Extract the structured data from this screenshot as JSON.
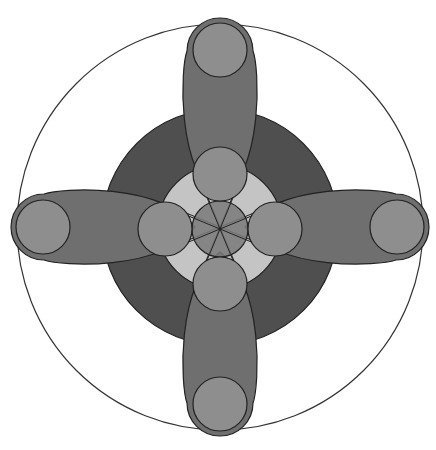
{
  "figure": {
    "width": 436,
    "height": 450,
    "center": [
      220,
      227
    ],
    "outer_circle": {
      "r": 203,
      "fill": "#ffffff",
      "stroke": "#333333"
    },
    "dark_disc": {
      "r": 118,
      "fill": "#4f4f4f",
      "stroke": "#222222"
    },
    "light_ring": {
      "r": 62,
      "fill": "#c4c4c4",
      "stroke": "#222222"
    },
    "petals": {
      "fill": "#6f6f6f",
      "stroke": "#222222",
      "length": 200,
      "half_width": 39,
      "directions": [
        "up",
        "right",
        "down",
        "left"
      ]
    },
    "small_circles": {
      "fill": "#8e8e8e",
      "stroke": "#222222",
      "r": 27,
      "inner_distance": 55,
      "outer_distance": 177
    },
    "center_disc": {
      "r": 28,
      "fill": "#7a7a7a",
      "stroke": "#222222"
    },
    "spokes": {
      "count": 8,
      "angles_deg": [
        22.5,
        67.5,
        112.5,
        157.5,
        202.5,
        247.5,
        292.5,
        337.5
      ],
      "stroke": "#222222"
    }
  }
}
